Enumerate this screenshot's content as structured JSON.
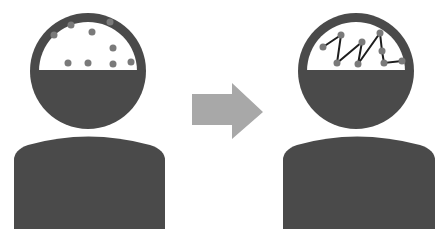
{
  "diagram": {
    "colors": {
      "background": "#ffffff",
      "figure": "#4a4a4a",
      "head_window": "#ffffff",
      "dots": "#7a7a7a",
      "lines": "#1e1e1e",
      "arrow": "#a8a8a8"
    },
    "left_figure": {
      "label": "",
      "dots": [
        [
          54,
          35
        ],
        [
          71,
          25
        ],
        [
          92,
          32
        ],
        [
          110,
          22
        ],
        [
          113,
          48
        ],
        [
          68,
          63
        ],
        [
          88,
          63
        ],
        [
          113,
          64
        ],
        [
          131,
          62
        ]
      ]
    },
    "arrow": {
      "direction": "right"
    },
    "right_figure": {
      "label": "",
      "points": [
        [
          323,
          47
        ],
        [
          341,
          35
        ],
        [
          337,
          63
        ],
        [
          362,
          42
        ],
        [
          358,
          64
        ],
        [
          380,
          33
        ],
        [
          382,
          51
        ],
        [
          384,
          63
        ],
        [
          402,
          61
        ]
      ]
    }
  }
}
